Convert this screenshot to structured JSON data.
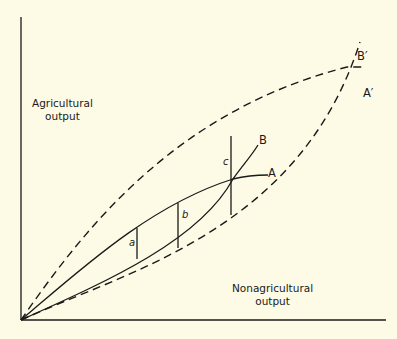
{
  "diagram": {
    "type": "production-possibility / expansion path diagram",
    "y_axis": {
      "label_line1": "Agricultural",
      "label_line2": "output"
    },
    "x_axis": {
      "label_line1": "Nonagricultural",
      "label_line2": "output"
    },
    "curves": [
      {
        "id": "A",
        "label": "A",
        "style": "solid"
      },
      {
        "id": "B",
        "label": "B",
        "style": "solid"
      },
      {
        "id": "A_prime",
        "label": "A′",
        "style": "dashed"
      },
      {
        "id": "B_prime",
        "label": "B′",
        "style": "dashed"
      }
    ],
    "segments": [
      {
        "id": "a",
        "label": "a"
      },
      {
        "id": "b",
        "label": "b"
      },
      {
        "id": "c",
        "label": "c"
      }
    ],
    "colors": {
      "background": "#fdfbe6",
      "ink": "#1a1a1a"
    }
  }
}
